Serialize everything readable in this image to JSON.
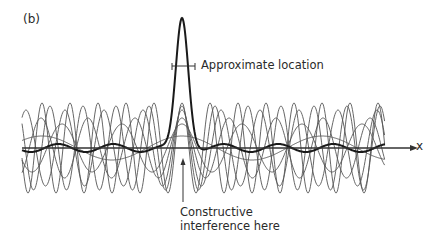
{
  "figure": {
    "panel_label": "(b)",
    "annotations": {
      "approximate_location": "Approximate location",
      "constructive_line1": "Constructive",
      "constructive_line2": "interference here"
    },
    "axis": {
      "label": "x"
    },
    "colors": {
      "waves": "#555555",
      "sum": "#1a1a1a",
      "axis": "#333333",
      "text": "#2a2a2a"
    },
    "geometry": {
      "axis_y": 148,
      "x_start": 22,
      "x_end": 385,
      "axis_end": 412,
      "peak_x": 182,
      "peak_top_y": 18,
      "peak_halfwidth": 10,
      "bracket_y": 66,
      "bracket_x1": 172,
      "bracket_x2": 195,
      "arrow_x": 183,
      "arrow_y_from": 202,
      "arrow_y_to": 158
    },
    "component_waves": [
      {
        "wavelength": 28,
        "amplitude": 45,
        "phase_at_peak": 0
      },
      {
        "wavelength": 33,
        "amplitude": 42,
        "phase_at_peak": 0
      },
      {
        "wavelength": 39,
        "amplitude": 38,
        "phase_at_peak": 0
      },
      {
        "wavelength": 47,
        "amplitude": 30,
        "phase_at_peak": 0
      },
      {
        "wavelength": 60,
        "amplitude": 24,
        "phase_at_peak": 0
      },
      {
        "wavelength": 140,
        "amplitude": 12,
        "phase_at_peak": 0
      }
    ]
  }
}
